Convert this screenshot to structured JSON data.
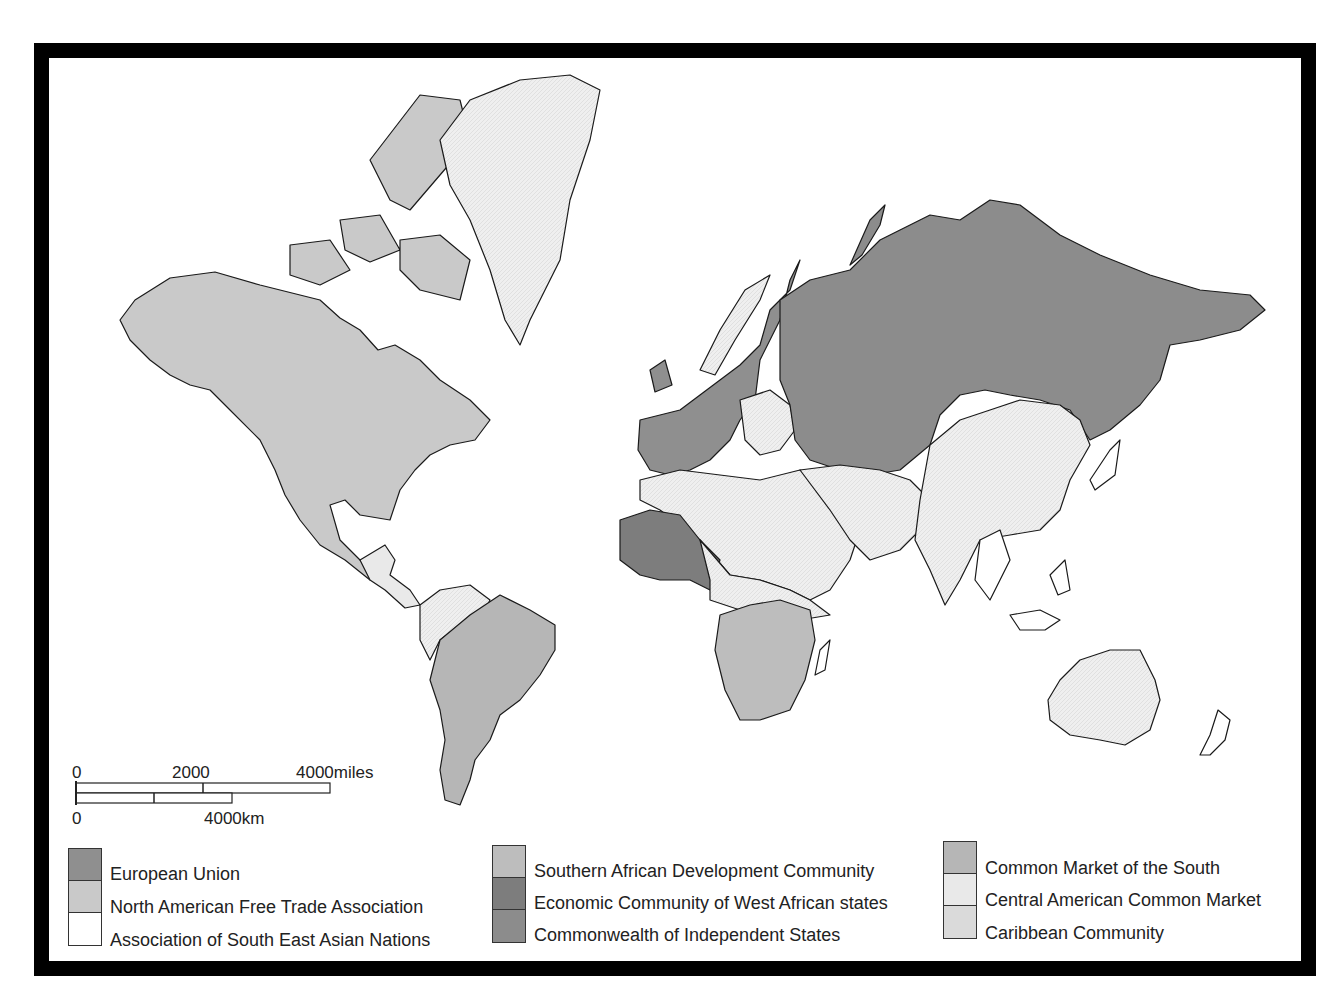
{
  "scale_bar": {
    "miles_labels": [
      "0",
      "2000",
      "4000miles"
    ],
    "km_labels": [
      "0",
      "4000km"
    ]
  },
  "legend": {
    "columns": [
      [
        {
          "label": "European Union",
          "color": "#8f8f8f"
        },
        {
          "label": "North American Free Trade Association",
          "color": "#c9c9c9"
        },
        {
          "label": "Association of South East Asian Nations",
          "color": "#ffffff"
        }
      ],
      [
        {
          "label": "Southern African Development Community",
          "color": "#bdbdbd"
        },
        {
          "label": "Economic Community of West African states",
          "color": "#7d7d7d"
        },
        {
          "label": "Commonwealth of Independent States",
          "color": "#8c8c8c"
        }
      ],
      [
        {
          "label": "Common Market of the South",
          "color": "#b6b6b6"
        },
        {
          "label": "Central American Common Market",
          "color": "#e9e9e9"
        },
        {
          "label": "Caribbean Community",
          "color": "#dadada"
        }
      ]
    ]
  },
  "map_colors": {
    "eu": "#8f8f8f",
    "nafta": "#c9c9c9",
    "asean": "#ffffff",
    "sadc": "#bdbdbd",
    "ecowas": "#7d7d7d",
    "cis": "#8c8c8c",
    "mercosur": "#b6b6b6",
    "other": "#eeeeee",
    "frame": "#000000"
  }
}
